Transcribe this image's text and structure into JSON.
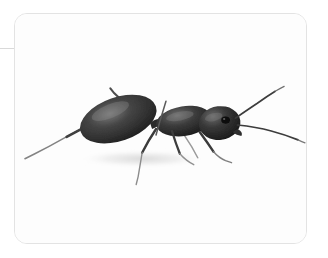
{
  "page": {
    "background_color": "#ffffff",
    "width": 328,
    "height": 258
  },
  "connector": {
    "name": "connector-line",
    "color": "#d9d9d9",
    "orientation": "horizontal"
  },
  "card": {
    "name": "image-card",
    "background_color": "#ffffff",
    "border_color": "#e3e3e3",
    "corner_radius_px": 13,
    "alt_text": "Close-up photograph of a black ant in profile facing right"
  },
  "photo": {
    "subject": "ant",
    "view": "side profile",
    "facing": "right",
    "color_mode": "grayscale",
    "background_color": "#fdfdfd",
    "body_color": "#2b2b2b",
    "body_highlight_color": "#6d6d6d",
    "limb_color": "#4a4a4a",
    "shadow_color": "#e6e6e6",
    "parts": [
      {
        "name": "gaster",
        "label": "abdomen"
      },
      {
        "name": "petiole",
        "label": "waist"
      },
      {
        "name": "mesosoma",
        "label": "thorax"
      },
      {
        "name": "head",
        "label": "head"
      },
      {
        "name": "eye",
        "label": "compound eye"
      },
      {
        "name": "antenna-upper",
        "label": "upper antenna"
      },
      {
        "name": "antenna-lower",
        "label": "lower antenna"
      },
      {
        "name": "mandible",
        "label": "mandible"
      },
      {
        "name": "leg-hind",
        "label": "hind leg"
      },
      {
        "name": "leg-mid-rear",
        "label": "middle rear leg"
      },
      {
        "name": "leg-mid-front",
        "label": "middle front leg"
      },
      {
        "name": "leg-fore",
        "label": "foreleg"
      },
      {
        "name": "leg-fore-far",
        "label": "far foreleg"
      },
      {
        "name": "leg-upper-rear",
        "label": "upper rear leg"
      },
      {
        "name": "ground-shadow",
        "label": "shadow"
      }
    ]
  }
}
